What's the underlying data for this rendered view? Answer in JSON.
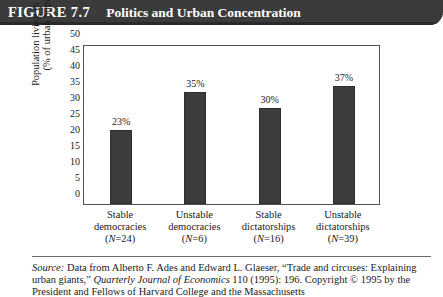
{
  "figure": {
    "number": "FIGURE 7.7",
    "title": "Politics and Urban Concentration"
  },
  "source": {
    "label": "Source:",
    "line1_rest": " Data from Alberto F. Ades and Edward L. Glaeser, “Trade and circuses:",
    "line2_a": "Explaining urban giants,” ",
    "line2_italic": "Quarterly Journal of Economics",
    "line2_b": " 110 (1995): 196. Copyright",
    "line3": "© 1995 by the President and Fellows of Harvard College and the Massachusetts"
  },
  "axis": {
    "ylabel_line1": "Population living in largest city",
    "ylabel_line2": "(% of urban population)",
    "yticks": [
      "50",
      "45",
      "40",
      "35",
      "30",
      "25",
      "20",
      "15",
      "10",
      "5",
      "0"
    ]
  },
  "chart_data": {
    "type": "bar",
    "title": "Politics and Urban Concentration",
    "categories": [
      "Stable democracies",
      "Unstable democracies",
      "Stable dictatorships",
      "Unstable dictatorships"
    ],
    "category_lines": [
      [
        "Stable",
        "democracies"
      ],
      [
        "Unstable",
        "democracies"
      ],
      [
        "Stable",
        "dictatorships"
      ],
      [
        "Unstable",
        "dictatorships"
      ]
    ],
    "n_values": [
      24,
      6,
      16,
      39
    ],
    "n_labels": [
      "(N=24)",
      "(N=6)",
      "(N=16)",
      "(N=39)"
    ],
    "values": [
      23,
      35,
      30,
      37
    ],
    "value_labels": [
      "23%",
      "35%",
      "30%",
      "37%"
    ],
    "xlabel": "",
    "ylabel": "Population living in largest city (% of urban population)",
    "ylim": [
      0,
      50
    ],
    "ytick_step": 5,
    "grid": false,
    "legend": false,
    "bar_color": "#3c3c3c"
  }
}
